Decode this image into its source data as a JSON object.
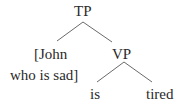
{
  "diagram": {
    "type": "syntax-tree",
    "nodes": {
      "root": {
        "label": "TP"
      },
      "subject_line1": {
        "label": "[John"
      },
      "subject_line2": {
        "label": "who is sad]"
      },
      "vp": {
        "label": "VP"
      },
      "verb": {
        "label": "is"
      },
      "adjective": {
        "label": "tired"
      }
    },
    "edges": [
      {
        "from": "TP",
        "to": "[John who is sad]"
      },
      {
        "from": "TP",
        "to": "VP"
      },
      {
        "from": "VP",
        "to": "is"
      },
      {
        "from": "VP",
        "to": "tired"
      }
    ],
    "colors": {
      "text": "#2a2a2a",
      "edge": "#6a6a6a",
      "background": "#ffffff"
    }
  }
}
